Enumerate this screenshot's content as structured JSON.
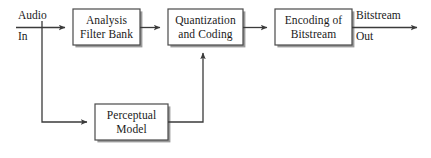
{
  "diagram": {
    "background_color": "#ffffff",
    "line_color": "#3b3b3b",
    "box_border_color": "#4a4a4a",
    "box_shadow_color": "#9a9a9a",
    "text_color": "#1a1a1a",
    "blocks": [
      {
        "id": "analysis-filter-bank",
        "line1": "Analysis",
        "line2": "Filter Bank",
        "x": 73,
        "y": 9,
        "w": 67,
        "h": 36
      },
      {
        "id": "quantization-and-coding",
        "line1": "Quantization",
        "line2": "and Coding",
        "x": 168,
        "y": 9,
        "w": 75,
        "h": 36
      },
      {
        "id": "encoding-of-bitstream",
        "line1": "Encoding of",
        "line2": "Bitstream",
        "x": 275,
        "y": 9,
        "w": 77,
        "h": 36
      },
      {
        "id": "perceptual-model",
        "line1": "Perceptual",
        "line2": "Model",
        "x": 95,
        "y": 104,
        "w": 73,
        "h": 36
      }
    ],
    "io_labels": [
      {
        "id": "audio-in-top",
        "text": "Audio",
        "x": 18,
        "y": 9
      },
      {
        "id": "audio-in-bottom",
        "text": "In",
        "x": 18,
        "y": 30
      },
      {
        "id": "bitstream-out-top",
        "text": "Bitstream",
        "x": 356,
        "y": 9
      },
      {
        "id": "bitstream-out-bottom",
        "text": "Out",
        "x": 356,
        "y": 30
      }
    ],
    "connections": [
      {
        "id": "audio-in-to-filter-bank",
        "from": "Audio In",
        "to": "Analysis Filter Bank"
      },
      {
        "id": "filter-bank-to-quantization",
        "from": "Analysis Filter Bank",
        "to": "Quantization and Coding"
      },
      {
        "id": "quantization-to-encoding",
        "from": "Quantization and Coding",
        "to": "Encoding of Bitstream"
      },
      {
        "id": "encoding-to-bitstream-out",
        "from": "Encoding of Bitstream",
        "to": "Bitstream Out"
      },
      {
        "id": "audio-tap-to-perceptual-model",
        "from": "Audio In",
        "to": "Perceptual Model"
      },
      {
        "id": "perceptual-model-to-quantization",
        "from": "Perceptual Model",
        "to": "Quantization and Coding"
      }
    ]
  }
}
